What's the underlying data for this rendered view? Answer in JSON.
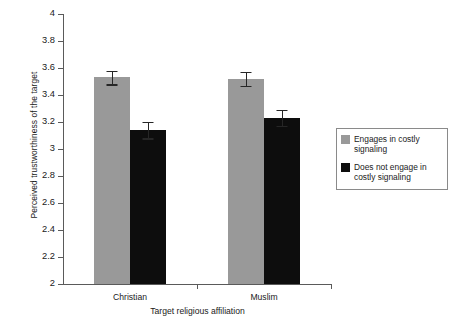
{
  "chart_data": {
    "type": "bar",
    "title": "",
    "subtitle": "",
    "xlabel": "Target religious affiliation",
    "ylabel": "Perceived trustworthiness of the target",
    "categories": [
      "Christian",
      "Muslim"
    ],
    "ylim": [
      2,
      4
    ],
    "ytick_labels": [
      "2",
      "2.2",
      "2.4",
      "2.6",
      "2.8",
      "3",
      "3.2",
      "3.4",
      "3.6",
      "3.8",
      "4"
    ],
    "ytick_values": [
      2,
      2.2,
      2.4,
      2.6,
      2.8,
      3,
      3.2,
      3.4,
      3.6,
      3.8,
      4
    ],
    "grid": false,
    "legend_position": "right",
    "series": [
      {
        "name": "Engages in costly signaling",
        "color": "#999999",
        "values": [
          3.53,
          3.52
        ],
        "errors": [
          0.05,
          0.05
        ]
      },
      {
        "name": "Does not engage in costly signaling",
        "color": "#0d0d0d",
        "values": [
          3.14,
          3.23
        ],
        "errors": [
          0.06,
          0.06
        ]
      }
    ]
  },
  "legend": {
    "items": [
      {
        "label_line1": "Engages in costly",
        "label_line2": "signaling",
        "color": "#999999"
      },
      {
        "label_line1": "Does not engage in",
        "label_line2": "costly signaling",
        "color": "#0d0d0d"
      }
    ]
  },
  "axes": {
    "y_title": "Perceived trustworthiness of the target",
    "x_title": "Target religious affiliation"
  }
}
